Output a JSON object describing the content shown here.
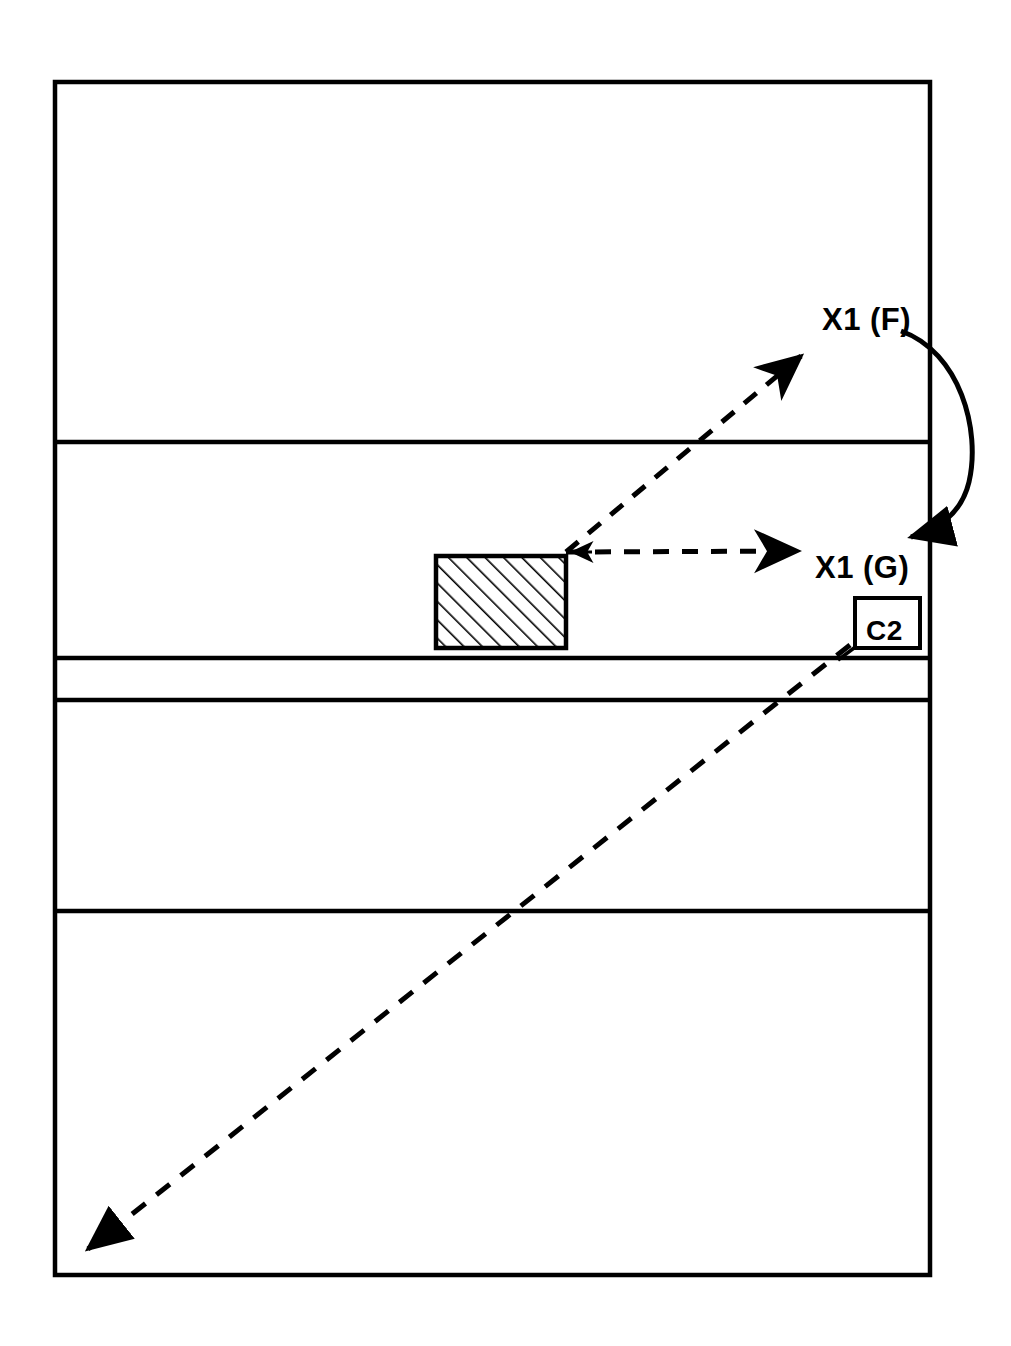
{
  "diagram": {
    "background_color": "#ffffff",
    "line_color": "#000000",
    "frame": {
      "name": "outer-frame",
      "x": 55,
      "y": 82,
      "width": 875,
      "height": 1193,
      "stroke_width": 4
    },
    "dividers": [
      {
        "name": "divider-1",
        "y": 442,
        "stroke_width": 4
      },
      {
        "name": "divider-2",
        "y": 658,
        "stroke_width": 4
      },
      {
        "name": "divider-3",
        "y": 700,
        "stroke_width": 4
      },
      {
        "name": "divider-4",
        "y": 911,
        "stroke_width": 4
      }
    ],
    "hatched_block": {
      "name": "hatched-block",
      "x": 435,
      "y": 555,
      "width": 131,
      "height": 93,
      "hatch_angle_deg": 45,
      "hatch_spacing": 13,
      "stroke_width": 4
    },
    "labels": [
      {
        "id": "x1f",
        "text": "X1 (F)",
        "x": 822,
        "y": 330,
        "size": "big"
      },
      {
        "id": "x1g",
        "text": "X1 (G)",
        "x": 815,
        "y": 578,
        "size": "big"
      },
      {
        "id": "c2",
        "text": "C2",
        "x": 866,
        "y": 640,
        "size": "box"
      }
    ],
    "label_box": {
      "name": "c2-label-box",
      "x": 855,
      "y": 598,
      "width": 65,
      "height": 50,
      "stroke_width": 4
    },
    "arrows": [
      {
        "id": "arrow-diagonal-x1f",
        "name": "dashed-arrow-to-x1f",
        "style": "dashed",
        "from_x": 566,
        "from_y": 552,
        "to_x": 808,
        "to_y": 350,
        "points_to": "X1 (F)"
      },
      {
        "id": "arrow-horizontal-x1g",
        "name": "dashed-arrow-to-x1g",
        "style": "dashed",
        "from_x": 566,
        "from_y": 552,
        "to_x": 805,
        "to_y": 551,
        "points_to": "X1 (G)"
      },
      {
        "id": "arrow-long-diagonal",
        "name": "dashed-arrow-long-diagonal",
        "style": "dashed",
        "from_x": 850,
        "from_y": 645,
        "to_x": 80,
        "to_y": 1255,
        "points_to": "lower-left-corner"
      },
      {
        "id": "arrow-curved",
        "name": "curved-arrow-x1f-to-x1g",
        "style": "solid-curve",
        "from_x": 903,
        "from_y": 332,
        "to_x": 906,
        "to_y": 541,
        "bulge_x": 975,
        "points_to": "X1 (G)"
      },
      {
        "id": "arrow-corner-tick",
        "name": "corner-arrowhead-into-block",
        "style": "solid",
        "to_x": 566,
        "to_y": 552,
        "points_to": "hatched-block-top-right-corner"
      }
    ],
    "leader_lines": [
      {
        "id": "leader-c2",
        "name": "c2-leader-line",
        "from_x": 840,
        "from_y": 658,
        "to_x": 862,
        "to_y": 640
      }
    ]
  }
}
